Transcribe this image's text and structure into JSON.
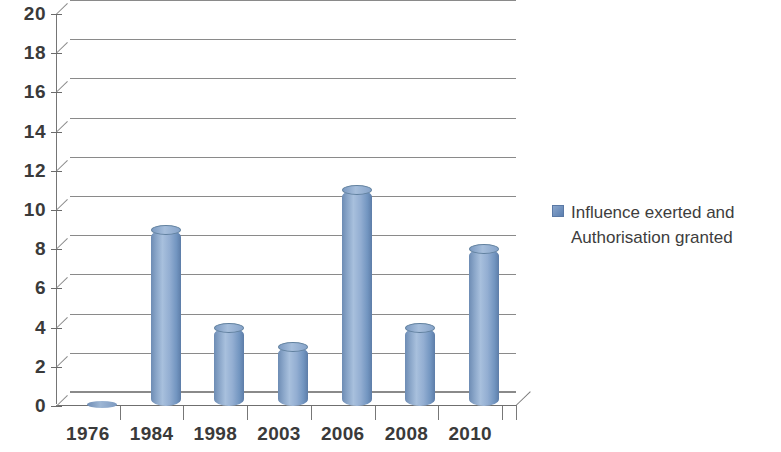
{
  "chart_data": {
    "type": "bar",
    "title": "",
    "subtitle": "",
    "xlabel": "",
    "ylabel": "",
    "categories": [
      "1976",
      "1984",
      "1998",
      "2003",
      "2006",
      "2008",
      "2010"
    ],
    "values": [
      0,
      9,
      4,
      3,
      11,
      4,
      8
    ],
    "series": [
      {
        "name": "Influence exerted and Authorisation granted",
        "values": [
          0,
          9,
          4,
          3,
          11,
          4,
          8
        ]
      }
    ],
    "ylim": [
      0,
      20
    ],
    "y_tick_step": 2,
    "y_ticks": [
      0,
      2,
      4,
      6,
      8,
      10,
      12,
      14,
      16,
      18,
      20
    ],
    "y_tick_labels": [
      "0",
      "2",
      "4",
      "6",
      "8",
      "10",
      "12",
      "14",
      "16",
      "18",
      "20"
    ],
    "grid": true,
    "grid_axis": "y",
    "legend_position": "right",
    "style": "3d-cylinder",
    "bar_color": "#88a5cb",
    "grid_color": "#8a8a8a",
    "background_color": "#ffffff",
    "text_color": "#3a3a3a"
  },
  "legend": {
    "entries": [
      {
        "label": "Influence exerted and\nAuthorisation granted",
        "color": "#6f92bf"
      }
    ]
  }
}
